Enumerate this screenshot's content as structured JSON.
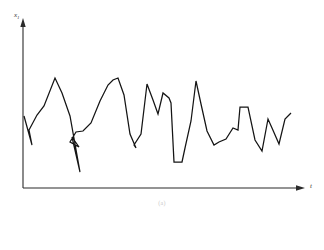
{
  "figure": {
    "caption": "(a)",
    "background_color": "#ffffff",
    "line_color": "#141414",
    "axis_color": "#2b2b2b"
  },
  "axes": {
    "y": {
      "label_main": "x",
      "label_sub": "1",
      "arrow": "up-arrow-icon",
      "origin_x": 23,
      "top_y": 20,
      "bottom_y": 188
    },
    "x": {
      "label_main": "t",
      "label_sub": "",
      "arrow": "right-arrow-icon",
      "origin_x": 23,
      "end_x": 305,
      "baseline_y": 188
    }
  },
  "chart_data": {
    "type": "line",
    "title": "",
    "subtitle": "",
    "xlabel": "t",
    "ylabel": "x1",
    "grid": false,
    "legend": "none",
    "axis_arrows": true,
    "tick_labels_x": [],
    "tick_labels_y": [],
    "xlim": [
      0,
      100
    ],
    "ylim": [
      0,
      100
    ],
    "series": [
      {
        "name": "x1(t)",
        "x": [
          0.4,
          3.2,
          5.7,
          8.2,
          11.3,
          14.2,
          17.0,
          20.2,
          23.0,
          25.9,
          28.7,
          31.6,
          34.4,
          36.2,
          38.0,
          40.8,
          43.6,
          45.4,
          47.2,
          50.0,
          52.8,
          55.7,
          58.5,
          61.3,
          64.2,
          67.0,
          69.8,
          72.7,
          75.5,
          78.4,
          81.2,
          84.0,
          86.9,
          89.7,
          92.6,
          95.4,
          98.2,
          100.0
        ],
        "y": [
          43.0,
          25.6,
          34.5,
          48.8,
          65.5,
          54.8,
          41.1,
          26.2,
          9.5,
          31.0,
          36.3,
          22.6,
          29.2,
          30.4,
          49.4,
          63.7,
          68.5,
          69.6,
          50.0,
          29.8,
          31.0,
          65.5,
          46.4,
          58.9,
          55.4,
          53.6,
          21.4,
          15.5,
          16.1,
          46.4,
          67.3,
          43.5,
          31.0,
          38.7,
          34.5,
          50.0,
          50.0,
          25.0
        ]
      }
    ]
  },
  "signal_path_points": "24,116 32,145 29,130 37,115 44,106 55,78 62,93 70,116 80,172 72,137 79,147 70,142 76,132 83,131 91,123 100,101 108,85 113,80 118,78 124,95 130,134 136,148 134,145 141,134 147,84 153,100 158,114 163,93 169,98 171,103 174,162 182,162 185,148 191,121 196,81 201,104 207,131 214,145 219,142 226,139 233,128 238,130 240,107 248,107 255,140 262,151 268,119 272,128 279,144 285,119 291,113"
}
